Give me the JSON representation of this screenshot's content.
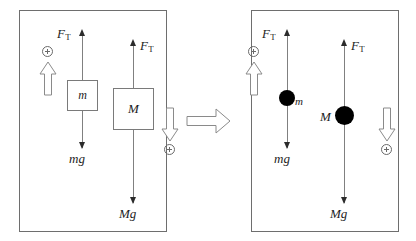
{
  "figure": {
    "type": "physics-free-body-diagram",
    "title": ""
  },
  "colors": {
    "panel_border": "#6e6e6e",
    "force_line": "#808080",
    "arrow_head": "#2b2b2b",
    "box_border": "#7a7a7a",
    "point_mass_fill": "#000000",
    "sign_symbol": "#6a6a6a",
    "block_arrow_stroke": "#8a8a8a",
    "block_arrow_fill": "#ffffff",
    "text": "#1d1d1d",
    "background": "#ffffff"
  },
  "transition_arrow": {
    "name": "implies-arrow",
    "glyph": "⟹",
    "direction": "right"
  },
  "left_panel": {
    "name": "before-panel",
    "caption": "",
    "bodies": [
      {
        "id": "small-block",
        "shape": "rectangle",
        "label": "m",
        "forces": {
          "up": {
            "symbol": "F",
            "subscript": "T",
            "text": "F_T"
          },
          "down": {
            "text": "mg"
          }
        }
      },
      {
        "id": "large-block",
        "shape": "rectangle",
        "label": "M",
        "forces": {
          "up": {
            "symbol": "F",
            "subscript": "T",
            "text": "F_T"
          },
          "down": {
            "text": "Mg"
          }
        }
      }
    ],
    "sign_conventions": [
      {
        "id": "positive-up",
        "symbol": "⊕",
        "direction": "up"
      },
      {
        "id": "positive-down",
        "symbol": "⊕",
        "direction": "down"
      }
    ]
  },
  "right_panel": {
    "name": "after-panel",
    "caption": "",
    "bodies": [
      {
        "id": "small-point-mass",
        "shape": "point",
        "label": "m",
        "label_side": "right",
        "forces": {
          "up": {
            "symbol": "F",
            "subscript": "T",
            "text": "F_T"
          },
          "down": {
            "text": "mg"
          }
        }
      },
      {
        "id": "large-point-mass",
        "shape": "point",
        "label": "M",
        "label_side": "left",
        "forces": {
          "up": {
            "symbol": "F",
            "subscript": "T",
            "text": "F_T"
          },
          "down": {
            "text": "Mg"
          }
        }
      }
    ],
    "sign_conventions": [
      {
        "id": "positive-up",
        "symbol": "⊕",
        "direction": "up"
      },
      {
        "id": "positive-down",
        "symbol": "⊕",
        "direction": "down"
      }
    ]
  },
  "labels": {
    "ft_symbol": "F",
    "ft_subscript": "T",
    "mass_small": "m",
    "mass_large": "M",
    "weight_small": "mg",
    "weight_large": "Mg"
  }
}
